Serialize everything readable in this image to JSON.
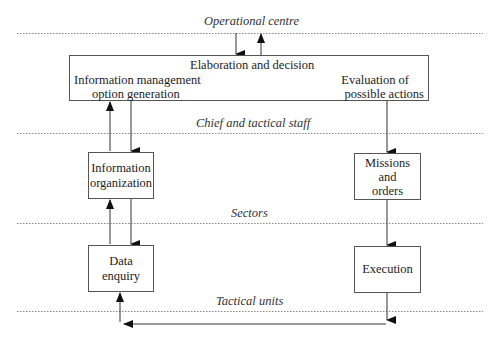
{
  "levels": [
    {
      "id": "operational",
      "label": "Operational centre"
    },
    {
      "id": "chief",
      "label": "Chief and tactical staff"
    },
    {
      "id": "sectors",
      "label": "Sectors"
    },
    {
      "id": "tactical",
      "label": "Tactical units"
    }
  ],
  "main_box": {
    "title": "Elaboration and decision",
    "left_line1": "Information management",
    "left_line2": "option generation",
    "right_line1": "Evaluation of",
    "right_line2": "possible actions"
  },
  "boxes": {
    "info_org": {
      "line1": "Information",
      "line2": "organization"
    },
    "missions": {
      "line1": "Missions",
      "line2": "and",
      "line3": "orders"
    },
    "data_enquiry": {
      "line1": "Data",
      "line2": "enquiry"
    },
    "execution": {
      "line1": "Execution"
    }
  },
  "colors": {
    "line": "#333333",
    "dotted": "#888888",
    "text": "#222222"
  }
}
